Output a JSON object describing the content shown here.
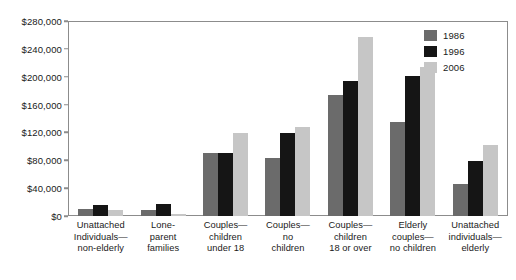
{
  "chart_data": {
    "type": "bar",
    "title": "",
    "xlabel": "",
    "ylabel": "",
    "ylim": [
      0,
      280000
    ],
    "grid": false,
    "legend_position": "top-right",
    "y_tick_labels": [
      "$280,000",
      "$240,000",
      "$200,000",
      "$160,000",
      "$120,000",
      "$80,000",
      "$40,000",
      "$0"
    ],
    "y_tick_values": [
      280000,
      240000,
      200000,
      160000,
      120000,
      80000,
      40000,
      0
    ],
    "categories": [
      "Unattached Individuals—non-elderly",
      "Lone-parent families",
      "Couples—children under 18",
      "Couples—no children",
      "Couples—children 18 or over",
      "Elderly couples—no children",
      "Unattached individuals—elderly"
    ],
    "category_lines": [
      [
        "Unattached",
        "Individuals—",
        "non-elderly"
      ],
      [
        "Lone-",
        "parent",
        "families"
      ],
      [
        "Couples—",
        "children",
        "under 18"
      ],
      [
        "Couples—",
        "no",
        "children"
      ],
      [
        "Couples—",
        "children",
        "18 or over"
      ],
      [
        "Elderly",
        "couples—",
        "no children"
      ],
      [
        "Unattached",
        "individuals—",
        "elderly"
      ]
    ],
    "series": [
      {
        "name": "1986",
        "color": "#6b6b6b",
        "values": [
          9000,
          8000,
          90000,
          83000,
          175000,
          135000,
          45000
        ]
      },
      {
        "name": "1996",
        "color": "#151515",
        "values": [
          15000,
          16000,
          91000,
          119000,
          195000,
          202000,
          79000
        ]
      },
      {
        "name": "2006",
        "color": "#c6c6c6",
        "values": [
          8000,
          2000,
          119000,
          128000,
          258000,
          215000,
          102000
        ]
      }
    ]
  },
  "legend": {
    "entries": [
      {
        "label": "1986"
      },
      {
        "label": "1996"
      },
      {
        "label": "2006"
      }
    ]
  }
}
